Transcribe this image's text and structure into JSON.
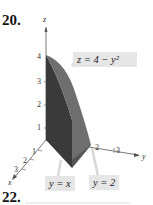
{
  "problem_number": "20.",
  "next_problem_number": "22.",
  "figure": {
    "axes": {
      "z": "z",
      "y": "y",
      "x": "x"
    },
    "z_ticks": [
      "1",
      "2",
      "3",
      "4"
    ],
    "y_ticks": [
      "2",
      "3"
    ],
    "x_ticks": [
      "1",
      "2",
      "3"
    ],
    "labels": {
      "surface": "z = 4 − y²",
      "plane1": "y = x",
      "plane2": "y = 2"
    }
  }
}
